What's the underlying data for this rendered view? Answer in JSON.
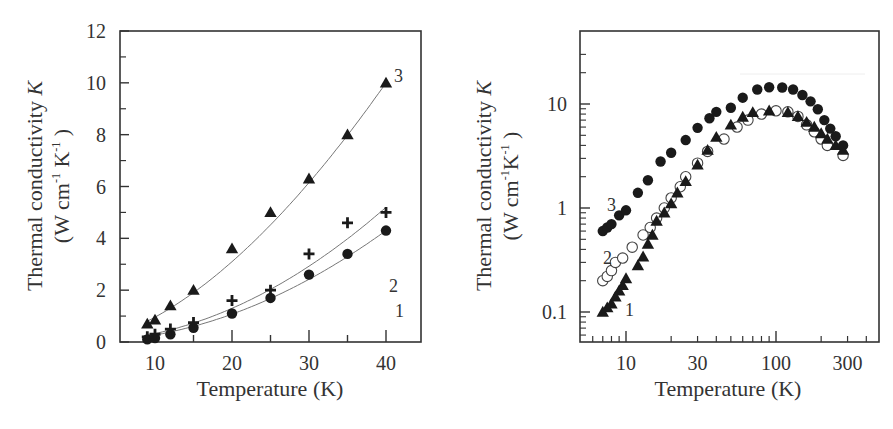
{
  "chart_data": [
    {
      "id": "left",
      "type": "scatter",
      "title": "",
      "xlabel": "Temperature (K)",
      "ylabel_line1": "Thermal conductivity K",
      "ylabel_line2": "(W cm-1 K-1 )",
      "xscale": "linear",
      "yscale": "linear",
      "xlim": [
        5.5,
        44.5
      ],
      "ylim": [
        0,
        12
      ],
      "xticks": [
        10,
        20,
        30,
        40
      ],
      "yticks": [
        0,
        2,
        4,
        6,
        8,
        10,
        12
      ],
      "grid": false,
      "legend": "inline numeric labels",
      "series": [
        {
          "name": "1",
          "marker": "filled-circle",
          "fit_line": true,
          "x": [
            9,
            10,
            12,
            15,
            20,
            25,
            30,
            35,
            40
          ],
          "y": [
            0.1,
            0.15,
            0.3,
            0.55,
            1.1,
            1.7,
            2.6,
            3.4,
            4.3
          ]
        },
        {
          "name": "2",
          "marker": "plus",
          "fit_line": true,
          "x": [
            9,
            10,
            12,
            15,
            20,
            25,
            30,
            35,
            40
          ],
          "y": [
            0.2,
            0.3,
            0.5,
            0.75,
            1.6,
            2.0,
            3.4,
            4.6,
            5.0
          ]
        },
        {
          "name": "3",
          "marker": "filled-triangle",
          "fit_line": true,
          "x": [
            9,
            10,
            12,
            15,
            20,
            25,
            30,
            35,
            40
          ],
          "y": [
            0.7,
            0.85,
            1.4,
            2.0,
            3.6,
            5.0,
            6.3,
            8.0,
            10.0
          ]
        }
      ]
    },
    {
      "id": "right",
      "type": "scatter",
      "title": "",
      "xlabel": "Temperature (K)",
      "ylabel_line1": "Thermal conductivity K",
      "ylabel_line2": "(W cm-1K-1 )",
      "xscale": "log",
      "yscale": "log",
      "xlim": [
        5,
        500
      ],
      "ylim": [
        0.05,
        50
      ],
      "xticks": [
        10,
        30,
        100,
        300
      ],
      "yticks": [
        0.1,
        1,
        10
      ],
      "grid": false,
      "legend": "inline numeric labels",
      "series": [
        {
          "name": "1",
          "marker": "filled-triangle",
          "x": [
            7,
            7.5,
            8,
            8.5,
            9,
            9.5,
            10,
            12,
            13,
            14,
            15,
            16,
            18,
            20,
            22,
            25,
            30,
            35,
            40,
            50,
            60,
            70,
            90,
            120,
            140,
            160,
            180,
            200,
            220,
            250,
            280
          ],
          "y": [
            0.1,
            0.11,
            0.12,
            0.14,
            0.16,
            0.18,
            0.21,
            0.28,
            0.34,
            0.45,
            0.55,
            0.75,
            0.9,
            1.1,
            1.4,
            1.8,
            2.6,
            3.6,
            4.8,
            6.3,
            7.5,
            8.3,
            8.6,
            8.3,
            7.6,
            6.7,
            6.0,
            5.2,
            4.6,
            4.0,
            3.6
          ]
        },
        {
          "name": "2",
          "marker": "open-circle",
          "x": [
            7,
            7.5,
            8,
            8.5,
            9.5,
            11,
            13,
            14.5,
            16,
            18,
            20,
            23,
            25,
            30,
            35,
            45,
            55,
            65,
            80,
            100,
            120,
            140,
            160,
            180,
            200,
            220,
            280
          ],
          "y": [
            0.2,
            0.22,
            0.25,
            0.3,
            0.33,
            0.42,
            0.55,
            0.65,
            0.8,
            1.0,
            1.25,
            1.6,
            2.0,
            2.7,
            3.5,
            4.6,
            6.0,
            7.0,
            8.0,
            8.6,
            8.4,
            7.6,
            6.3,
            5.4,
            4.6,
            4.0,
            3.2
          ]
        },
        {
          "name": "3",
          "marker": "filled-circle",
          "x": [
            7,
            7.5,
            8,
            9,
            10,
            12,
            14,
            17,
            20,
            25,
            30,
            36,
            40,
            50,
            60,
            75,
            90,
            110,
            130,
            150,
            170,
            190,
            210,
            230,
            250,
            280
          ],
          "y": [
            0.6,
            0.65,
            0.7,
            0.85,
            0.95,
            1.4,
            1.85,
            2.8,
            3.4,
            4.5,
            5.9,
            7.3,
            8.4,
            9.2,
            11.5,
            13.8,
            14.5,
            14.4,
            13.8,
            12.2,
            10.6,
            8.9,
            7.0,
            5.8,
            4.9,
            4.0
          ]
        }
      ]
    }
  ],
  "labels": {
    "left": {
      "ylabel_main": "Thermal conductivity ",
      "ylabel_k": "K",
      "ylabel_units_a": "(W cm",
      "ylabel_units_b": " K",
      "ylabel_units_c": " )",
      "sup": "-1",
      "xlabel": "Temperature (K)",
      "yticks": [
        "0",
        "2",
        "4",
        "6",
        "8",
        "10",
        "12"
      ],
      "xticks": [
        "10",
        "20",
        "30",
        "40"
      ],
      "s1": "1",
      "s2": "2",
      "s3": "3"
    },
    "right": {
      "ylabel_main": "Thermal conductivity ",
      "ylabel_k": "K",
      "ylabel_units_a": "(W cm",
      "ylabel_units_b": "K",
      "ylabel_units_c": " )",
      "sup": "-1",
      "xlabel": "Temperature (K)",
      "yticks": [
        "0.1",
        "1",
        "10"
      ],
      "xticks": [
        "10",
        "30",
        "100",
        "300"
      ],
      "s1": "1",
      "s2": "2",
      "s3": "3"
    }
  },
  "colors": {
    "axis": "#333333",
    "marker": "#1a1a1a",
    "fit": "#777777"
  }
}
